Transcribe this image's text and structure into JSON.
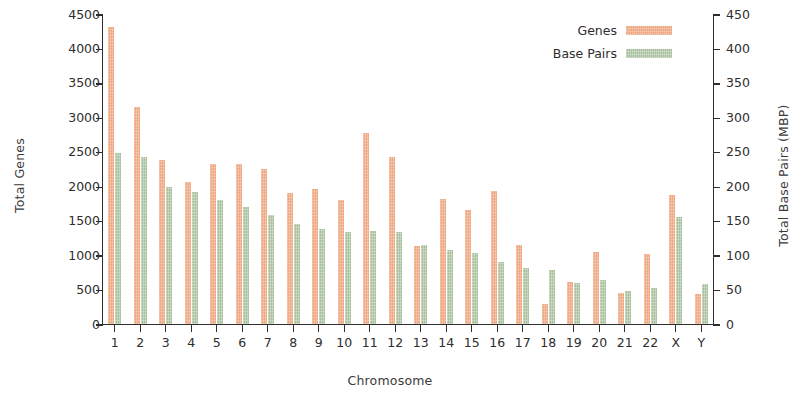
{
  "chart_data": {
    "type": "bar",
    "title": "",
    "xlabel": "Chromosome",
    "ylabel": "Total Genes",
    "y2label": "Total Base Pairs (MBP)",
    "categories": [
      "1",
      "2",
      "3",
      "4",
      "5",
      "6",
      "7",
      "8",
      "9",
      "10",
      "11",
      "12",
      "13",
      "14",
      "15",
      "16",
      "17",
      "18",
      "19",
      "20",
      "21",
      "22",
      "X",
      "Y"
    ],
    "ylim": [
      0,
      4500
    ],
    "y2lim": [
      0,
      450
    ],
    "yticks": [
      0,
      500,
      1000,
      1500,
      2000,
      2500,
      3000,
      3500,
      4000,
      4500
    ],
    "y2ticks": [
      0,
      50,
      100,
      150,
      200,
      250,
      300,
      350,
      400,
      450
    ],
    "grid": false,
    "legend_position": "top-right",
    "series": [
      {
        "name": "Genes",
        "axis": "left",
        "color": "#f0a882",
        "values": [
          4300,
          3140,
          2370,
          2050,
          2320,
          2310,
          2250,
          1900,
          1960,
          1790,
          2770,
          2420,
          1120,
          1810,
          1650,
          1930,
          1140,
          280,
          610,
          1040,
          450,
          1010,
          1860,
          430
        ]
      },
      {
        "name": "Base Pairs",
        "axis": "right",
        "color": "#a8bf9c",
        "values": [
          248,
          242,
          199,
          191,
          180,
          170,
          158,
          145,
          138,
          133,
          135,
          133,
          114,
          107,
          102,
          90,
          81,
          78,
          59,
          63,
          48,
          51,
          155,
          57
        ]
      }
    ]
  },
  "legend": {
    "items": [
      {
        "label": "Genes"
      },
      {
        "label": "Base Pairs"
      }
    ]
  }
}
